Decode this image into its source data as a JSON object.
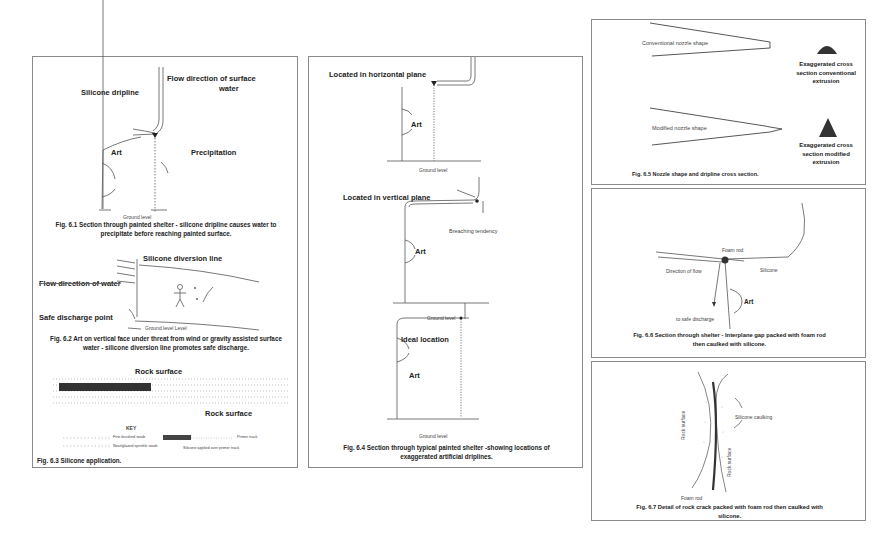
{
  "fig_6_1": {
    "labels": {
      "dripline": "Silicone dripline",
      "flow_line1": "Flow direction of surface",
      "flow_line2": "water",
      "art": "Art",
      "precipitation": "Precipitation",
      "ground": "Ground level"
    },
    "caption_line1": "Fig. 6.1 Section through painted shelter - silicone dripline causes water to",
    "caption_line2": "precipitate before reaching painted surface."
  },
  "fig_6_2": {
    "labels": {
      "diversion": "Silicone diversion line",
      "flow": "Flow direction of water",
      "discharge": "Safe discharge point",
      "ground": "Ground level  Level"
    },
    "caption_line1": "Fig. 6.2 Art on vertical face under threat from wind or gravity assisted surface",
    "caption_line2": "water - silicone diversion line promotes safe discharge."
  },
  "fig_6_3": {
    "labels": {
      "rock_top": "Rock surface",
      "rock_right": "Rock surface",
      "key": "KEY",
      "key_fine": "Fine brushed swab",
      "key_sprinkle": "Neat/glazed sprinkle swab",
      "key_primer": "Primer track",
      "key_silicone": "Silicone applied over primer track"
    },
    "caption": "Fig. 6.3 Silicone application."
  },
  "fig_6_4": {
    "labels": {
      "horizontal": "Located in horizontal plane",
      "vertical": "Located in vertical plane",
      "breaching": "Breaching tendency",
      "ideal": "Ideal location",
      "art": "Art",
      "ground": "Ground level"
    },
    "caption_line1": "Fig. 6.4  Section through typical painted shelter -showing locations of",
    "caption_line2": "exaggerated artificial driplines."
  },
  "fig_6_5": {
    "labels": {
      "conventional": "Conventional nozzle shape",
      "modified": "Modified nozzle shape",
      "conv_cs_1": "Exaggerated cross",
      "conv_cs_2": "section conventional",
      "conv_cs_3": "extrusion",
      "mod_cs_1": "Exaggerated cross",
      "mod_cs_2": "section modified",
      "mod_cs_3": "extrusion"
    },
    "caption": "Fig. 6.5 Nozzle shape and dripline cross section."
  },
  "fig_6_6": {
    "labels": {
      "foam": "Foam rod",
      "flow": "Direction of flow",
      "silicone": "Silicone",
      "art": "Art",
      "discharge": "to safe discharge"
    },
    "caption_line1": "Fig. 6.6 Section through shelter - Interplane gap packed with foam rod",
    "caption_line2": "then caulked with silicone."
  },
  "fig_6_7": {
    "labels": {
      "caulking": "Silicone caulking",
      "rock_left": "Rock surface",
      "rock_right": "Rock surface",
      "foam": "Foam rod"
    },
    "caption_line1": "Fig. 6.7  Detail of rock crack packed with foam rod then caulked with",
    "caption_line2": "silicone."
  },
  "colors": {
    "border": "#8a8a8a",
    "ink": "#222222",
    "sketch": "#555555"
  }
}
